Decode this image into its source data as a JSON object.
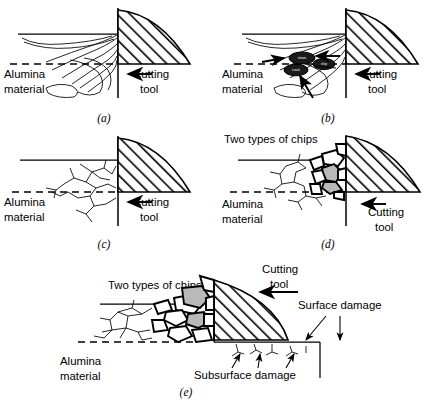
{
  "figure": {
    "background": "#ffffff",
    "ink_color": "#000000",
    "chip_grey": "#b9b9b9"
  },
  "common_labels": {
    "alumina_line1": "Alumina",
    "alumina_line2": "material",
    "cutting_line1": "Cutting",
    "cutting_line2": "tool",
    "two_types_of_chips": "Two types of chips",
    "surface_damage": "Surface damage",
    "subsurface_damage": "Subsurface damage"
  },
  "panels": [
    {
      "id": "a",
      "tag": "(a)",
      "caption": "Plastic flow / deformation contours ahead of tool",
      "labels": {
        "alumina_line1": "Alumina",
        "alumina_line2": "material",
        "cutting_line1": "Cutting",
        "cutting_line2": "tool"
      }
    },
    {
      "id": "b",
      "tag": "(b)",
      "caption": "Nucleation of cracks at flow lines",
      "labels": {
        "alumina_line1": "Alumina",
        "alumina_line2": "material",
        "cutting_line1": "Cutting",
        "cutting_line2": "tool"
      },
      "callout_ellipses": [
        {
          "text": "strain"
        },
        {
          "text": "chip"
        },
        {
          "text": "crack"
        }
      ]
    },
    {
      "id": "c",
      "tag": "(c)",
      "caption": "Crack propagation and fragmentation",
      "labels": {
        "alumina_line1": "Alumina",
        "alumina_line2": "material",
        "cutting_line1": "Cutting",
        "cutting_line2": "tool"
      }
    },
    {
      "id": "d",
      "tag": "(d)",
      "caption": "Formation of two types of chips",
      "labels": {
        "alumina_line1": "Alumina",
        "alumina_line2": "material",
        "cutting_line1": "Cutting",
        "cutting_line2": "tool",
        "two_types_of_chips": "Two types of chips"
      }
    },
    {
      "id": "e",
      "tag": "(e)",
      "caption": "Resulting machined surface with surface and subsurface damage",
      "labels": {
        "alumina_line1": "Alumina",
        "alumina_line2": "material",
        "cutting_line1": "Cutting",
        "cutting_line2": "tool",
        "two_types_of_chips": "Two types of chips",
        "surface_damage": "Surface damage",
        "subsurface_damage": "Subsurface damage"
      }
    }
  ]
}
